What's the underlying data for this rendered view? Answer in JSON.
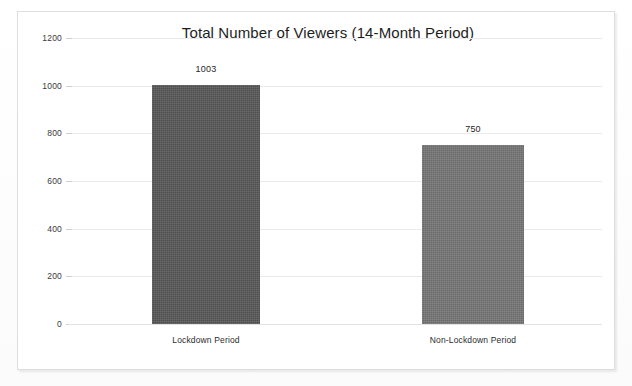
{
  "chart_data": {
    "type": "bar",
    "title": "Total Number of Viewers (14-Month Period)",
    "xlabel": "",
    "ylabel": "",
    "categories": [
      "Lockdown Period",
      "Non-Lockdown Period"
    ],
    "values": [
      1003,
      750
    ],
    "value_labels": [
      "1003",
      "750"
    ],
    "ylim": [
      0,
      1200
    ],
    "ytick_labels": [
      "0",
      "200",
      "400",
      "600",
      "800",
      "1000",
      "1200"
    ],
    "ytick_values": [
      0,
      200,
      400,
      600,
      800,
      1000,
      1200
    ],
    "grid": true,
    "grid_axis": "y",
    "legend": false,
    "legend_position": "none",
    "bar_colors": [
      "#585858",
      "#767676"
    ],
    "series": [
      {
        "name": "Total Number of Viewers",
        "values": [
          1003,
          750
        ]
      }
    ]
  },
  "frame": {
    "border_color": "#dedede",
    "background": "#ffffff"
  },
  "axis": {
    "gridline_color": "#eaeaea",
    "baseline_color": "#e3e3e3",
    "tick_text_color": "#3a3a3a"
  }
}
